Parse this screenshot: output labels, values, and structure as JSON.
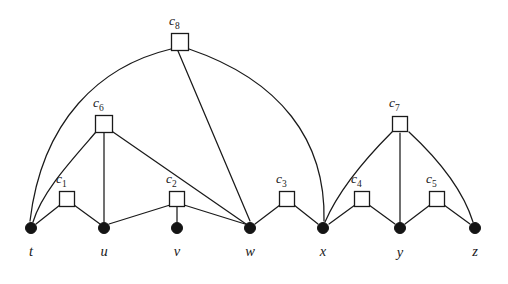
{
  "figure": {
    "kind": "hypergraph-clause-variable-incidence-diagram",
    "background_color": "#ffffff",
    "ink_color": "#1a1a1a"
  },
  "variables": [
    {
      "id": "t",
      "label": "t",
      "x": 31,
      "y": 228,
      "label_x": 31,
      "label_y": 256,
      "radius": 5.5
    },
    {
      "id": "u",
      "label": "u",
      "x": 104,
      "y": 228,
      "label_x": 104,
      "label_y": 256,
      "radius": 5.5
    },
    {
      "id": "v",
      "label": "v",
      "x": 177,
      "y": 228,
      "label_x": 177,
      "label_y": 256,
      "radius": 5.5
    },
    {
      "id": "w",
      "label": "w",
      "x": 250,
      "y": 228,
      "label_x": 250,
      "label_y": 256,
      "radius": 5.5
    },
    {
      "id": "x",
      "label": "x",
      "x": 323,
      "y": 228,
      "label_x": 323,
      "label_y": 256,
      "radius": 5.5
    },
    {
      "id": "y",
      "label": "y",
      "x": 400,
      "y": 228,
      "label_x": 400,
      "label_y": 257,
      "radius": 5.5
    },
    {
      "id": "z",
      "label": "z",
      "x": 475,
      "y": 228,
      "label_x": 475,
      "label_y": 256,
      "radius": 5.5
    }
  ],
  "clauses": [
    {
      "id": "c1",
      "base": "c",
      "sub": "1",
      "x": 67,
      "y": 199,
      "size": 15,
      "label_x": 56,
      "label_y": 183
    },
    {
      "id": "c2",
      "base": "c",
      "sub": "2",
      "x": 177,
      "y": 199,
      "size": 15,
      "label_x": 166,
      "label_y": 183
    },
    {
      "id": "c3",
      "base": "c",
      "sub": "3",
      "x": 287,
      "y": 199,
      "size": 15,
      "label_x": 276,
      "label_y": 183
    },
    {
      "id": "c4",
      "base": "c",
      "sub": "4",
      "x": 362,
      "y": 199,
      "size": 15,
      "label_x": 351,
      "label_y": 183
    },
    {
      "id": "c5",
      "base": "c",
      "sub": "5",
      "x": 437,
      "y": 199,
      "size": 15,
      "label_x": 426,
      "label_y": 183
    },
    {
      "id": "c6",
      "base": "c",
      "sub": "6",
      "x": 104,
      "y": 124,
      "size": 17,
      "label_x": 93,
      "label_y": 107
    },
    {
      "id": "c7",
      "base": "c",
      "sub": "7",
      "x": 400,
      "y": 124,
      "size": 15,
      "label_x": 389,
      "label_y": 107
    },
    {
      "id": "c8",
      "base": "c",
      "sub": "8",
      "x": 180,
      "y": 42,
      "size": 17,
      "label_x": 169,
      "label_y": 25
    }
  ],
  "edges": [
    {
      "from": "c1",
      "to": "t",
      "shape": "line",
      "d": "M 60,205 L 36,224"
    },
    {
      "from": "c1",
      "to": "u",
      "shape": "line",
      "d": "M 74,205 L 100,224"
    },
    {
      "from": "c2",
      "to": "u",
      "shape": "line",
      "d": "M 170,205 L 109,224"
    },
    {
      "from": "c2",
      "to": "v",
      "shape": "line",
      "d": "M 177,207 L 177,222"
    },
    {
      "from": "c2",
      "to": "w",
      "shape": "line",
      "d": "M 184,205 L 245,224"
    },
    {
      "from": "c3",
      "to": "w",
      "shape": "line",
      "d": "M 280,205 L 255,224"
    },
    {
      "from": "c3",
      "to": "x",
      "shape": "line",
      "d": "M 294,205 L 318,224"
    },
    {
      "from": "c4",
      "to": "x",
      "shape": "line",
      "d": "M 355,205 L 329,224"
    },
    {
      "from": "c4",
      "to": "y",
      "shape": "line",
      "d": "M 369,205 L 395,224"
    },
    {
      "from": "c5",
      "to": "y",
      "shape": "line",
      "d": "M 430,205 L 405,224"
    },
    {
      "from": "c5",
      "to": "z",
      "shape": "line",
      "d": "M 444,205 L 470,224"
    },
    {
      "from": "c6",
      "to": "t",
      "shape": "curve",
      "d": "M 96,132 C 70,162 42,192 33,222"
    },
    {
      "from": "c6",
      "to": "u",
      "shape": "line",
      "d": "M 104,133 L 104,222"
    },
    {
      "from": "c6",
      "to": "w",
      "shape": "line",
      "d": "M 113,132 L 246,224"
    },
    {
      "from": "c7",
      "to": "x",
      "shape": "curve",
      "d": "M 392,132 C 366,158 338,192 325,222"
    },
    {
      "from": "c7",
      "to": "y",
      "shape": "line",
      "d": "M 400,133 L 400,222"
    },
    {
      "from": "c7",
      "to": "z",
      "shape": "curve",
      "d": "M 409,132 C 437,158 463,190 473,222"
    },
    {
      "from": "c8",
      "to": "t",
      "shape": "curve",
      "d": "M 171,49 C 100,66 42,120 30,221"
    },
    {
      "from": "c8",
      "to": "w",
      "shape": "line",
      "d": "M 178,51 L 250,221"
    },
    {
      "from": "c8",
      "to": "x",
      "shape": "curve",
      "d": "M 189,49 C 280,80 326,140 324,221"
    }
  ]
}
